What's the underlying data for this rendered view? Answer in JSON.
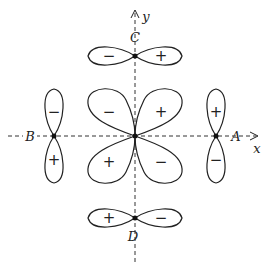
{
  "diagram": {
    "axes": {
      "x_label": "x",
      "y_label": "y"
    },
    "points": {
      "A": {
        "label": "A"
      },
      "B": {
        "label": "B"
      },
      "C": {
        "label": "C"
      },
      "D": {
        "label": "D"
      }
    },
    "center_lobes": {
      "upper_left": "−",
      "upper_right": "+",
      "lower_left": "+",
      "lower_right": "−"
    },
    "lobe_C": {
      "left": "−",
      "right": "+"
    },
    "lobe_D": {
      "left": "+",
      "right": "−"
    },
    "lobe_A": {
      "top": "+",
      "bottom": "−"
    },
    "lobe_B": {
      "top": "−",
      "bottom": "+"
    }
  }
}
